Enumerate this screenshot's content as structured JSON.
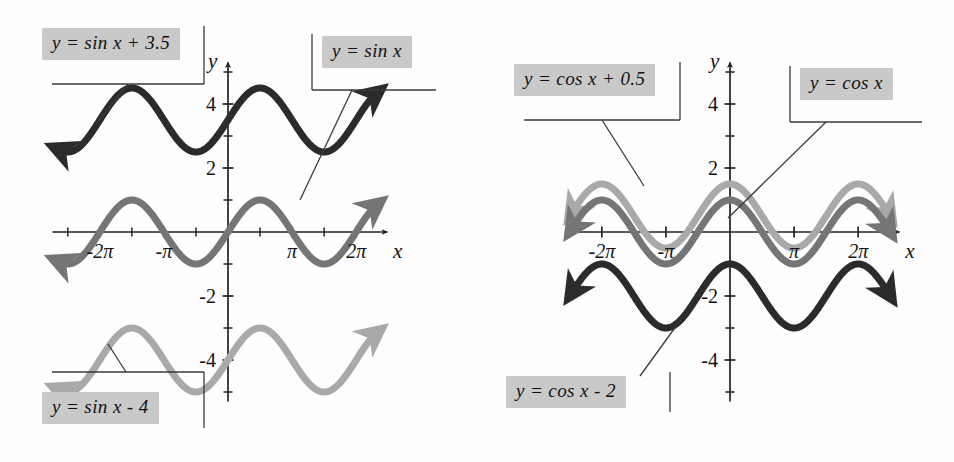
{
  "figure": {
    "background_color": "#fefefe"
  },
  "colors": {
    "dark": "#2b2b2b",
    "medium": "#757575",
    "light": "#a9a9a9",
    "axis": "#222222",
    "label_box_bg": "#c9c9c9",
    "label_box_text": "#111111",
    "leader_line": "#3a3a3a"
  },
  "panels": [
    {
      "id": "left-panel",
      "name": "sine-translations-plot",
      "axis": {
        "x_label": "x",
        "y_label": "y",
        "x_ticks": [
          {
            "value": -6.2832,
            "label": "-2π"
          },
          {
            "value": -3.1416,
            "label": "-π"
          },
          {
            "value": 3.1416,
            "label": "π"
          },
          {
            "value": 6.2832,
            "label": "2π"
          }
        ],
        "x_minor_ticks": [
          -7.854,
          -4.712,
          -1.5708,
          1.5708,
          4.712,
          7.854
        ],
        "y_ticks": [
          {
            "value": 4,
            "label": "4"
          },
          {
            "value": 2,
            "label": "2"
          },
          {
            "value": -2,
            "label": "-2"
          },
          {
            "value": -4,
            "label": "-4"
          }
        ],
        "y_minor_ticks": [
          5,
          3,
          1,
          -1,
          -3,
          -5
        ],
        "xlim": [
          -8.6,
          8.4
        ],
        "ylim": [
          -5.6,
          5.6
        ],
        "grid": false
      },
      "curves": [
        {
          "name": "curve-sin-plus-3p5",
          "expression": "sin(x) + 3.5",
          "amplitude": 1,
          "vertical_shift": 3.5,
          "function": "sin",
          "color_key": "dark",
          "stroke_width": 7,
          "arrow_start": true,
          "arrow_end": true
        },
        {
          "name": "curve-sin",
          "expression": "sin(x)",
          "amplitude": 1,
          "vertical_shift": 0,
          "function": "sin",
          "color_key": "medium",
          "stroke_width": 7,
          "arrow_start": true,
          "arrow_end": true
        },
        {
          "name": "curve-sin-minus-4",
          "expression": "sin(x) - 4",
          "amplitude": 1,
          "vertical_shift": -4,
          "function": "sin",
          "color_key": "light",
          "stroke_width": 7,
          "arrow_start": true,
          "arrow_end": true
        }
      ],
      "callouts": [
        {
          "name": "label-sin-plus-3p5",
          "text": "y = sin x + 3.5",
          "box": {
            "left": 42,
            "top": 28,
            "width": 172,
            "height": 34
          },
          "frame": {
            "left": 52,
            "top": 62,
            "width": 152,
            "height": 22,
            "sides": "right-bottom"
          },
          "leader": {
            "x1": 128,
            "y1": 84,
            "x2": 98,
            "y2": 122
          }
        },
        {
          "name": "label-sin",
          "text": "y = sin x",
          "box": {
            "left": 322,
            "top": 36,
            "width": 114,
            "height": 34
          },
          "frame": {
            "left": 312,
            "top": 70,
            "width": 124,
            "height": 20,
            "sides": "left-bottom"
          },
          "leader": {
            "x1": 352,
            "y1": 90,
            "x2": 300,
            "y2": 200
          }
        },
        {
          "name": "label-sin-minus-4",
          "text": "y = sin x - 4",
          "box": {
            "left": 42,
            "top": 392,
            "width": 152,
            "height": 34
          },
          "frame": {
            "left": 52,
            "top": 372,
            "width": 152,
            "height": 20,
            "sides": "right-top"
          },
          "leader": {
            "x1": 126,
            "y1": 372,
            "x2": 108,
            "y2": 344
          }
        }
      ]
    },
    {
      "id": "right-panel",
      "name": "cosine-translations-plot",
      "axis": {
        "x_label": "x",
        "y_label": "y",
        "x_ticks": [
          {
            "value": -6.2832,
            "label": "-2π"
          },
          {
            "value": -3.1416,
            "label": "-π"
          },
          {
            "value": 3.1416,
            "label": "π"
          },
          {
            "value": 6.2832,
            "label": "2π"
          }
        ],
        "x_minor_ticks": [
          -4.712,
          -1.5708,
          1.5708,
          4.712
        ],
        "y_ticks": [
          {
            "value": 4,
            "label": "4"
          },
          {
            "value": 2,
            "label": "2"
          },
          {
            "value": -2,
            "label": "-2"
          },
          {
            "value": -4,
            "label": "-4"
          }
        ],
        "y_minor_ticks": [
          5,
          3,
          1,
          -1,
          -3,
          -5
        ],
        "xlim": [
          -8.2,
          8.6
        ],
        "ylim": [
          -5.6,
          5.6
        ],
        "grid": false
      },
      "curves": [
        {
          "name": "curve-cos-plus-0p5",
          "expression": "cos(x) + 0.5",
          "amplitude": 1,
          "vertical_shift": 0.5,
          "function": "cos",
          "color_key": "light",
          "stroke_width": 7,
          "arrow_start": true,
          "arrow_end": true
        },
        {
          "name": "curve-cos",
          "expression": "cos(x)",
          "amplitude": 1,
          "vertical_shift": 0,
          "function": "cos",
          "color_key": "medium",
          "stroke_width": 7,
          "arrow_start": true,
          "arrow_end": true
        },
        {
          "name": "curve-cos-minus-2",
          "expression": "cos(x) - 2",
          "amplitude": 1,
          "vertical_shift": -2,
          "function": "cos",
          "color_key": "dark",
          "stroke_width": 7,
          "arrow_start": true,
          "arrow_end": true
        }
      ],
      "callouts": [
        {
          "name": "label-cos-plus-0p5",
          "text": "y = cos x + 0.5",
          "box": {
            "left": 44,
            "top": 64,
            "width": 176,
            "height": 34
          },
          "frame": {
            "left": 54,
            "top": 98,
            "width": 156,
            "height": 22,
            "sides": "right-bottom"
          },
          "leader": {
            "x1": 132,
            "y1": 120,
            "x2": 174,
            "y2": 186
          }
        },
        {
          "name": "label-cos",
          "text": "y = cos x",
          "box": {
            "left": 330,
            "top": 68,
            "width": 122,
            "height": 34
          },
          "frame": {
            "left": 320,
            "top": 102,
            "width": 132,
            "height": 20,
            "sides": "left-bottom"
          },
          "leader": {
            "x1": 356,
            "y1": 122,
            "x2": 258,
            "y2": 218
          }
        },
        {
          "name": "label-cos-minus-2",
          "text": "y = cos x - 2",
          "box": {
            "left": 36,
            "top": 376,
            "width": 160,
            "height": 34
          },
          "frame": {
            "left": 186,
            "top": 376,
            "width": 14,
            "height": 34,
            "sides": "right-only"
          },
          "leader": {
            "x1": 170,
            "y1": 376,
            "x2": 212,
            "y2": 318
          }
        }
      ]
    }
  ]
}
